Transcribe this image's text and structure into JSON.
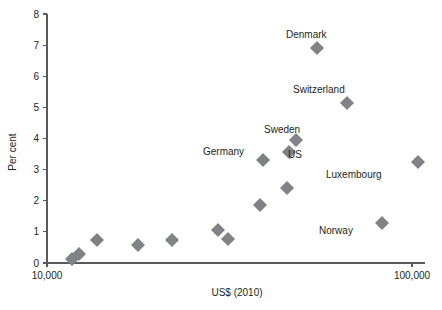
{
  "chart_data": {
    "type": "scatter",
    "title": "",
    "xlabel": "US$ (2010)",
    "ylabel": "Per cent",
    "xscale": "log",
    "xlim": [
      10000,
      115000
    ],
    "ylim": [
      0,
      8
    ],
    "grid": false,
    "legend": "none",
    "xticks": [
      {
        "value": 10000,
        "label": "10,000"
      },
      {
        "value": 100000,
        "label": "100,000"
      }
    ],
    "yticks": [
      {
        "value": 0,
        "label": "0"
      },
      {
        "value": 1,
        "label": "1"
      },
      {
        "value": 2,
        "label": "2"
      },
      {
        "value": 3,
        "label": "3"
      },
      {
        "value": 4,
        "label": "4"
      },
      {
        "value": 5,
        "label": "5"
      },
      {
        "value": 6,
        "label": "6"
      },
      {
        "value": 7,
        "label": "7"
      },
      {
        "value": 8,
        "label": "8"
      }
    ],
    "marker": {
      "shape": "diamond",
      "color": "#808285",
      "size": 7
    },
    "points": [
      {
        "px": 72,
        "py": 259,
        "x": 11700,
        "y": 0.15,
        "label": ""
      },
      {
        "px": 79,
        "py": 254,
        "x": 12500,
        "y": 0.3,
        "label": ""
      },
      {
        "px": 97,
        "py": 240,
        "x": 14800,
        "y": 0.75,
        "label": ""
      },
      {
        "px": 138,
        "py": 245,
        "x": 21800,
        "y": 0.6,
        "label": ""
      },
      {
        "px": 172,
        "py": 240,
        "x": 29500,
        "y": 0.75,
        "label": ""
      },
      {
        "px": 218,
        "py": 230,
        "x": 42000,
        "y": 1.05,
        "label": ""
      },
      {
        "px": 228,
        "py": 239,
        "x": 45500,
        "y": 0.78,
        "label": ""
      },
      {
        "px": 260,
        "py": 205,
        "x": 58000,
        "y": 1.85,
        "label": ""
      },
      {
        "px": 287,
        "py": 188,
        "x": 70000,
        "y": 2.4,
        "label": ""
      },
      {
        "px": 263,
        "py": 160,
        "x": 59500,
        "y": 3.3,
        "label": "Germany"
      },
      {
        "px": 289,
        "py": 152,
        "x": 71000,
        "y": 3.57,
        "label": "US"
      },
      {
        "px": 296,
        "py": 140,
        "x": 74500,
        "y": 3.95,
        "label": "Sweden"
      },
      {
        "px": 317,
        "py": 48,
        "x": 86000,
        "y": 6.9,
        "label": "Denmark"
      },
      {
        "px": 347,
        "py": 103,
        "x": 104000,
        "y": 5.15,
        "label": "Switzerland"
      },
      {
        "px": 382,
        "py": 223,
        "x": 128000,
        "y": 1.28,
        "label": "Norway"
      },
      {
        "px": 418,
        "py": 162,
        "x": 158000,
        "y": 3.25,
        "label": "Luxembourg"
      }
    ],
    "annotations": [
      {
        "text": "Denmark",
        "px": 286,
        "py": 38,
        "anchor": "start"
      },
      {
        "text": "Switzerland",
        "px": 293,
        "py": 93,
        "anchor": "start"
      },
      {
        "text": "Sweden",
        "px": 264,
        "py": 133,
        "anchor": "start"
      },
      {
        "text": "Germany",
        "px": 203,
        "py": 155,
        "anchor": "start"
      },
      {
        "text": "US",
        "px": 288,
        "py": 158,
        "anchor": "start"
      },
      {
        "text": "Luxembourg",
        "px": 326,
        "py": 178,
        "anchor": "start"
      },
      {
        "text": "Norway",
        "px": 319,
        "py": 234,
        "anchor": "start"
      }
    ],
    "axis": {
      "x_axis_y_px": 263,
      "y_axis_x_px": 47,
      "x_axis_left_px": 47,
      "x_axis_right_px": 425,
      "y_axis_top_px": 14
    },
    "colors": {
      "marker": "#808285",
      "axis": "#58595b",
      "text": "#231f20",
      "background": "#ffffff"
    }
  }
}
